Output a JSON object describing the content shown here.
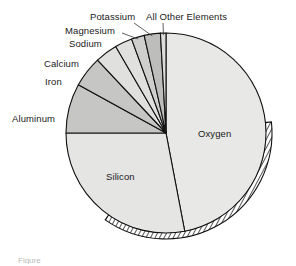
{
  "figure": {
    "background_color": "#ffffff",
    "partial_caption": "Figure"
  },
  "chart_data": {
    "type": "pie",
    "title": "",
    "subtitle": "",
    "xlabel": "",
    "ylabel": "",
    "legend_position": "none",
    "grid": false,
    "start_angle_deg": 0,
    "direction": "clockwise",
    "center": {
      "x": 166,
      "y": 133
    },
    "radius": 100,
    "categories": [
      "Oxygen",
      "Silicon",
      "Aluminum",
      "Iron",
      "Calcium",
      "Sodium",
      "Magnesium",
      "Potassium",
      "All Other Elements"
    ],
    "values": [
      47.0,
      28.0,
      8.0,
      5.0,
      3.6,
      2.8,
      2.1,
      2.6,
      0.9
    ],
    "units": "percent by mass",
    "slices": [
      {
        "label": "Oxygen",
        "value": 47.0,
        "start_deg": 0.0,
        "end_deg": 169.2,
        "fill": "#e8e8e6",
        "label_placement": "inside",
        "label_x": 198,
        "label_y": 128
      },
      {
        "label": "Silicon",
        "value": 28.0,
        "start_deg": 169.2,
        "end_deg": 270.0,
        "fill": "#e5e5e3",
        "label_placement": "inside",
        "label_x": 106,
        "label_y": 171
      },
      {
        "label": "Aluminum",
        "value": 8.0,
        "start_deg": 270.0,
        "end_deg": 298.8,
        "fill": "#c6c6c4",
        "label_placement": "outside-left",
        "label_x": 12,
        "label_y": 113
      },
      {
        "label": "Iron",
        "value": 5.0,
        "start_deg": 298.8,
        "end_deg": 316.8,
        "fill": "#c6c6c4",
        "label_placement": "outside-left",
        "label_x": 45,
        "label_y": 76
      },
      {
        "label": "Calcium",
        "value": 3.6,
        "start_deg": 316.8,
        "end_deg": 329.8,
        "fill": "#e0e0de",
        "label_placement": "outside-left",
        "label_x": 44,
        "label_y": 58
      },
      {
        "label": "Sodium",
        "value": 2.8,
        "start_deg": 329.8,
        "end_deg": 339.9,
        "fill": "#e0e0de",
        "label_placement": "outside-top",
        "label_x": 69,
        "label_y": 38
      },
      {
        "label": "Magnesium",
        "value": 2.1,
        "start_deg": 339.9,
        "end_deg": 347.4,
        "fill": "#cfcfcd",
        "label_placement": "outside-top",
        "label_x": 65,
        "label_y": 25
      },
      {
        "label": "Potassium",
        "value": 2.6,
        "start_deg": 347.4,
        "end_deg": 356.8,
        "fill": "#bdbdbb",
        "label_placement": "outside-top",
        "label_x": 90,
        "label_y": 11
      },
      {
        "label": "All Other Elements",
        "value": 0.9,
        "start_deg": 356.8,
        "end_deg": 360.0,
        "fill": "#dcdcda",
        "label_placement": "outside-top",
        "label_x": 146,
        "label_y": 11
      }
    ],
    "rim": {
      "style": "hatched-3d-edge",
      "fill": "#ffffff",
      "hatch_color": "#2b2b2b",
      "start_deg": 84,
      "end_deg": 215
    },
    "stroke_color": "#111111",
    "stroke_width": 1.1
  },
  "labels": {
    "oxygen": "Oxygen",
    "silicon": "Silicon",
    "aluminum": "Aluminum",
    "iron": "Iron",
    "calcium": "Calcium",
    "sodium": "Sodium",
    "magnesium": "Magnesium",
    "potassium": "Potassium",
    "all_other": "All Other Elements"
  }
}
